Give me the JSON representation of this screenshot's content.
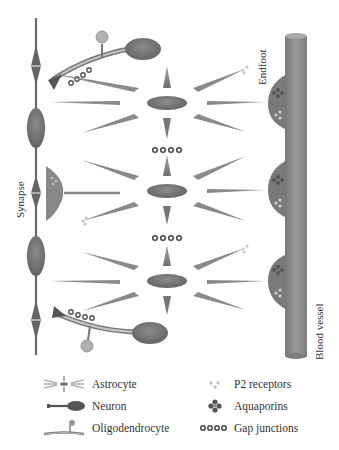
{
  "diagram": {
    "labels": {
      "synapse": "Synapse",
      "endfoot": "Endfoot",
      "blood_vessel": "Blood vessel"
    },
    "colors": {
      "cell_body": "#6e6e6e",
      "process": "#8a8a8a",
      "vessel": "#8c8c8c",
      "endfoot": "#787878",
      "myelin": "#b5b5b5",
      "receptor": "#c8c8c8",
      "text": "#333333"
    },
    "astrocytes": [
      {
        "id": "astrocyte-top",
        "cx": 167,
        "cy": 103
      },
      {
        "id": "astrocyte-middle",
        "cx": 167,
        "cy": 191
      },
      {
        "id": "astrocyte-bottom",
        "cx": 167,
        "cy": 281
      }
    ],
    "gap_junction_groups": [
      {
        "id": "gap-junctions-upper",
        "y": 150
      },
      {
        "id": "gap-junctions-lower",
        "y": 238
      }
    ],
    "endfeet": [
      {
        "id": "endfoot-top",
        "cy": 103
      },
      {
        "id": "endfoot-middle",
        "cy": 191
      },
      {
        "id": "endfoot-bottom",
        "cy": 281
      }
    ]
  },
  "legend": {
    "left": [
      {
        "icon": "astrocyte-icon",
        "label": "Astrocyte"
      },
      {
        "icon": "neuron-icon",
        "label": "Neuron"
      },
      {
        "icon": "oligodendrocyte-icon",
        "label": "Oligodendrocyte"
      }
    ],
    "right": [
      {
        "icon": "p2-receptor-icon",
        "label": "P2 receptors"
      },
      {
        "icon": "aquaporin-icon",
        "label": "Aquaporins"
      },
      {
        "icon": "gap-junction-icon",
        "label": "Gap junctions"
      }
    ]
  }
}
